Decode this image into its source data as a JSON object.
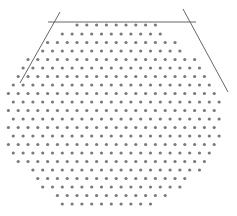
{
  "figure": {
    "dot_color": "#7a7a7a",
    "line_color": "#555555",
    "dot_radius": 1.6,
    "pitch_x": 9.8,
    "lines": [
      {
        "name": "top-edge-line",
        "x1": 48,
        "y1": 22,
        "x2": 196,
        "y2": 22
      },
      {
        "name": "left-slant-line",
        "x1": 60,
        "y1": 12,
        "x2": 20,
        "y2": 83
      },
      {
        "name": "right-slant-line",
        "x1": 183,
        "y1": 9,
        "x2": 228,
        "y2": 92
      }
    ],
    "rows": [
      {
        "y": 25,
        "x0": 77.0,
        "n": 9
      },
      {
        "y": 34,
        "x0": 62.3,
        "n": 11
      },
      {
        "y": 42.5,
        "x0": 47.6,
        "n": 14
      },
      {
        "y": 51,
        "x0": 42.7,
        "n": 15
      },
      {
        "y": 59.5,
        "x0": 28.0,
        "n": 18
      },
      {
        "y": 68,
        "x0": 23.1,
        "n": 19
      },
      {
        "y": 76.5,
        "x0": 18.2,
        "n": 20
      },
      {
        "y": 85,
        "x0": 13.3,
        "n": 21
      },
      {
        "y": 93.5,
        "x0": 8.4,
        "n": 22
      },
      {
        "y": 102,
        "x0": 13.3,
        "n": 22
      },
      {
        "y": 110.5,
        "x0": 8.4,
        "n": 22
      },
      {
        "y": 119,
        "x0": 13.3,
        "n": 22
      },
      {
        "y": 127.5,
        "x0": 8.4,
        "n": 22
      },
      {
        "y": 136,
        "x0": 13.3,
        "n": 22
      },
      {
        "y": 144.5,
        "x0": 8.4,
        "n": 22
      },
      {
        "y": 153,
        "x0": 13.3,
        "n": 21
      },
      {
        "y": 161.5,
        "x0": 18.2,
        "n": 20
      },
      {
        "y": 170,
        "x0": 32.9,
        "n": 18
      },
      {
        "y": 178.5,
        "x0": 37.8,
        "n": 16
      },
      {
        "y": 187,
        "x0": 42.7,
        "n": 15
      },
      {
        "y": 195.5,
        "x0": 57.4,
        "n": 12
      },
      {
        "y": 204,
        "x0": 62.3,
        "n": 10
      }
    ]
  }
}
